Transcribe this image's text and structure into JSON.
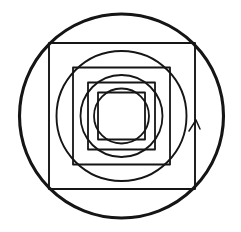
{
  "figure": {
    "title": "Nested concentric circles and squares",
    "background_color": "#ffffff",
    "stroke_color": "#151515",
    "canvas": {
      "width": 241,
      "height": 232
    },
    "center": {
      "x": 121.5,
      "y": 116.0
    },
    "layer_count": 9,
    "layers": [
      {
        "index": 0,
        "name": "outer-circle",
        "type": "circle",
        "label": "Outermost circle",
        "cx": 121.5,
        "cy": 116.0,
        "r": 102.0,
        "stroke_width": 3.1,
        "stroke_color": "#151515"
      },
      {
        "index": 1,
        "name": "square-1",
        "type": "square",
        "label": "First square",
        "x": 49.0,
        "y": 43.0,
        "width": 146.0,
        "height": 146.0,
        "half_side": 73.0,
        "stroke_width": 1.9,
        "stroke_color": "#151515"
      },
      {
        "index": 2,
        "name": "circle-2",
        "type": "circle",
        "label": "Second circle",
        "cx": 121.5,
        "cy": 116.0,
        "r": 65.0,
        "stroke_width": 1.9,
        "stroke_color": "#151515"
      },
      {
        "index": 3,
        "name": "square-2",
        "type": "square",
        "label": "Second square",
        "x": 73.0,
        "y": 67.5,
        "width": 97.0,
        "height": 97.0,
        "half_side": 48.5,
        "stroke_width": 1.8,
        "stroke_color": "#151515"
      },
      {
        "index": 4,
        "name": "circle-3",
        "type": "circle",
        "label": "Third circle",
        "cx": 121.5,
        "cy": 116.0,
        "r": 41.0,
        "stroke_width": 1.8,
        "stroke_color": "#151515"
      },
      {
        "index": 5,
        "name": "square-3",
        "type": "square",
        "label": "Third square",
        "x": 88.0,
        "y": 82.5,
        "width": 67.0,
        "height": 67.0,
        "half_side": 33.5,
        "stroke_width": 1.8,
        "stroke_color": "#151515"
      },
      {
        "index": 6,
        "name": "circle-4",
        "type": "circle",
        "label": "Innermost circle",
        "cx": 121.5,
        "cy": 116.0,
        "r": 27.5,
        "stroke_width": 1.8,
        "stroke_color": "#151515"
      },
      {
        "index": 7,
        "name": "square-4",
        "type": "square",
        "label": "Innermost square",
        "x": 98.0,
        "y": 92.5,
        "width": 47.0,
        "height": 47.0,
        "half_side": 23.5,
        "stroke_width": 1.8,
        "stroke_color": "#151515"
      }
    ],
    "artifact": {
      "name": "arrowhead-tick",
      "label": "Small arrowhead tick on right edge of first square",
      "apex": {
        "x": 196.0,
        "y": 120.0
      },
      "left_barb": {
        "x": 189.0,
        "y": 131.0
      },
      "right_barb": {
        "x": 200.0,
        "y": 129.0
      },
      "stroke_width": 1.5,
      "stroke_color": "#151515"
    }
  }
}
